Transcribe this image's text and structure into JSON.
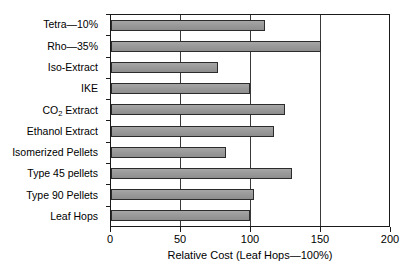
{
  "chart_data": {
    "type": "bar",
    "orientation": "horizontal",
    "title": "",
    "xlabel": "Relative Cost (Leaf Hops—100%)",
    "ylabel": "",
    "categories": [
      "Tetra—10%",
      "Rho—35%",
      "Iso-Extract",
      "IKE",
      "CO2 Extract",
      "Ethanol Extract",
      "Isomerized Pellets",
      "Type 45 pellets",
      "Type 90 Pellets",
      "Leaf Hops"
    ],
    "values": [
      111,
      151,
      77,
      100,
      125,
      117,
      83,
      130,
      103,
      100
    ],
    "xlim": [
      0,
      200
    ],
    "xticks": [
      0,
      50,
      100,
      150,
      200
    ],
    "xtick_labels": [
      "0",
      "50",
      "100",
      "150",
      "200"
    ],
    "gridlines": [
      50,
      100,
      150
    ],
    "grid": "vertical",
    "legend": "none",
    "bar_fill": "#9a9a9a",
    "bar_edge": "#2b2b2b",
    "plot_background": "#ffffff",
    "axis_color": "#1a1a1a"
  }
}
